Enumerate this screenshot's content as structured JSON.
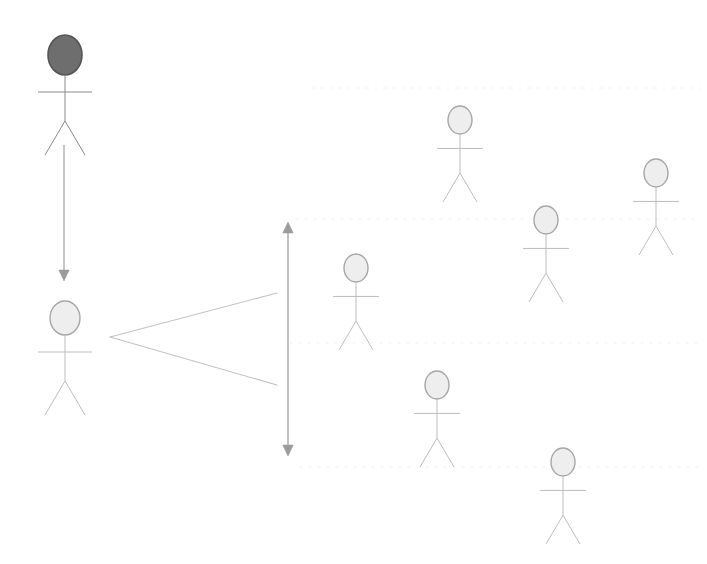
{
  "canvas": {
    "width": 707,
    "height": 564,
    "background": "#ffffff",
    "title": "Actor relationship diagram"
  },
  "palette": {
    "actor_stroke_light": "#9a9a9a",
    "actor_fill_light": "#e8e8e8",
    "actor_stroke_dark": "#555555",
    "actor_fill_dark": "#6e6e6e",
    "arrow_color": "#9b9b9b",
    "fan_line_color": "#bdbdbd",
    "guide_line_color": "#ededed"
  },
  "actors": [
    {
      "id": "actor-primary-dark",
      "name": "actor-primary-dark",
      "label": "",
      "cx": 65,
      "cy": 55,
      "rx": 17,
      "ry": 20,
      "scale": 1.0,
      "style": "dark",
      "fill": "#6e6e6e",
      "stroke": "#555555"
    },
    {
      "id": "actor-secondary-left",
      "name": "actor-secondary-left",
      "label": "",
      "cx": 65,
      "cy": 318,
      "rx": 15,
      "ry": 17,
      "scale": 1.0,
      "style": "light",
      "fill": "#eeeeee",
      "stroke": "#a6a6a6"
    },
    {
      "id": "actor-right-top",
      "name": "actor-right-top",
      "label": "",
      "cx": 460,
      "cy": 120,
      "rx": 12,
      "ry": 14,
      "scale": 0.85,
      "style": "light",
      "fill": "#eeeeee",
      "stroke": "#a6a6a6"
    },
    {
      "id": "actor-right-far",
      "name": "actor-right-far",
      "label": "",
      "cx": 656,
      "cy": 173,
      "rx": 12,
      "ry": 14,
      "scale": 0.85,
      "style": "light",
      "fill": "#eeeeee",
      "stroke": "#a6a6a6"
    },
    {
      "id": "actor-right-middle",
      "name": "actor-right-middle",
      "label": "",
      "cx": 546,
      "cy": 220,
      "rx": 12,
      "ry": 14,
      "scale": 0.85,
      "style": "light",
      "fill": "#eeeeee",
      "stroke": "#a6a6a6"
    },
    {
      "id": "actor-center-upper",
      "name": "actor-center-upper",
      "label": "",
      "cx": 356,
      "cy": 268,
      "rx": 12,
      "ry": 14,
      "scale": 0.85,
      "style": "light",
      "fill": "#eeeeee",
      "stroke": "#a6a6a6"
    },
    {
      "id": "actor-center-lower",
      "name": "actor-center-lower",
      "label": "",
      "cx": 437,
      "cy": 385,
      "rx": 12,
      "ry": 14,
      "scale": 0.85,
      "style": "light",
      "fill": "#eeeeee",
      "stroke": "#a6a6a6"
    },
    {
      "id": "actor-bottom-right",
      "name": "actor-bottom-right",
      "label": "",
      "cx": 563,
      "cy": 462,
      "rx": 12,
      "ry": 14,
      "scale": 0.85,
      "style": "light",
      "fill": "#eeeeee",
      "stroke": "#a6a6a6"
    }
  ],
  "connectors": {
    "vertical_flow_arrow": {
      "name": "vertical-flow-arrow",
      "label": "",
      "x1": 64,
      "y1": 145,
      "x2": 64,
      "y2": 281,
      "color": "#9b9b9b",
      "head": "end"
    },
    "vertical_span_arrow": {
      "name": "vertical-span-arrow",
      "label": "",
      "x1": 288,
      "y1": 222,
      "x2": 288,
      "y2": 456,
      "color": "#9b9b9b",
      "head": "both"
    },
    "fan": {
      "name": "fan-branch-connector",
      "label": "",
      "apex_x": 110,
      "apex_y": 337,
      "upper_x": 277,
      "upper_y": 293,
      "lower_x": 277,
      "lower_y": 385,
      "color": "#c2c2c2"
    }
  },
  "guide_lines": [
    {
      "name": "guide-line-1",
      "y": 88,
      "x1": 312,
      "x2": 700,
      "color": "#efefef"
    },
    {
      "name": "guide-line-2",
      "y": 219,
      "x1": 296,
      "x2": 700,
      "color": "#efefef"
    },
    {
      "name": "guide-line-3",
      "y": 343,
      "x1": 290,
      "x2": 700,
      "color": "#efefef"
    },
    {
      "name": "guide-line-4",
      "y": 467,
      "x1": 300,
      "x2": 700,
      "color": "#efefef"
    }
  ]
}
